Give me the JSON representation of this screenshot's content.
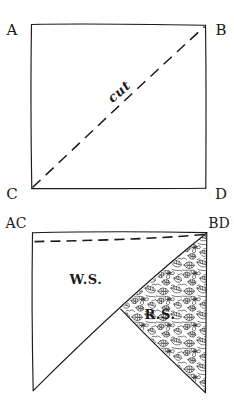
{
  "figure": {
    "ink_color": "#1a1a1a",
    "paper_color": "#ffffff",
    "print_color": "#222222"
  },
  "top_figure": {
    "name": "square-with-diagonal-cut",
    "corners": {
      "top_left": "A",
      "top_right": "B",
      "bottom_left": "C",
      "bottom_right": "D"
    },
    "cut_line_label": "cut",
    "cut_line_style": "dashed",
    "cut_from": "C",
    "cut_to": "B"
  },
  "bottom_figure": {
    "name": "folded-triangle-piece",
    "corners": {
      "top_left": "AC",
      "top_right": "BD"
    },
    "wrong_side_label": "W.S.",
    "right_side_label": "R.S.",
    "fold_line_style": "dashed",
    "print_region": "floral-print"
  }
}
